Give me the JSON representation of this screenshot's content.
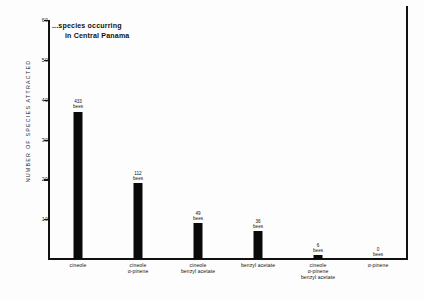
{
  "chart_data": {
    "type": "bar",
    "title": "",
    "xlabel": "",
    "ylabel": "NUMBER  OF  SPECIES  ATTRACTED",
    "ylim": [
      0,
      60
    ],
    "yticks": [
      10,
      20,
      30,
      40,
      50,
      60
    ],
    "grid": false,
    "legend": false,
    "annotation": {
      "line1": "...species occurring",
      "line2": "in Central Panama"
    },
    "categories": [
      [
        "cineole"
      ],
      [
        "cineole",
        "α-pinene"
      ],
      [
        "cineole",
        "benzyl acetate"
      ],
      [
        "benzyl acetate"
      ],
      [
        "cineole",
        "α-pinene",
        "benzyl acetate"
      ],
      [
        "α-pinene"
      ]
    ],
    "values": [
      37,
      19,
      9,
      7,
      1,
      0
    ],
    "point_labels": [
      {
        "num": "433",
        "unit": "bees"
      },
      {
        "num": "112",
        "unit": "bees"
      },
      {
        "num": "49",
        "unit": "bees"
      },
      {
        "num": "36",
        "unit": "bees"
      },
      {
        "num": "6",
        "unit": "bees"
      },
      {
        "num": "0",
        "unit": "bees"
      }
    ],
    "bar_color": "#0a0a0a",
    "axis_color": "#111111"
  }
}
